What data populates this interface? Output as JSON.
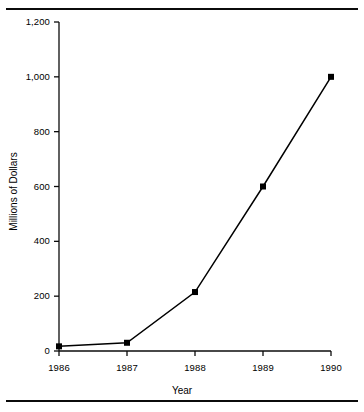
{
  "chart_data": {
    "type": "line",
    "title": "",
    "subtitle": "",
    "xlabel": "Year",
    "ylabel": "Millions of Dollars",
    "categories": [
      "1986",
      "1987",
      "1988",
      "1989",
      "1990"
    ],
    "x": [
      1986,
      1987,
      1988,
      1989,
      1990
    ],
    "values": [
      17,
      30,
      215,
      600,
      1000
    ],
    "series": [
      {
        "name": "Millions of Dollars",
        "values": [
          17,
          30,
          215,
          600,
          1000
        ]
      }
    ],
    "ylim": [
      0,
      1200
    ],
    "yticks": [
      0,
      200,
      400,
      600,
      800,
      1000,
      1200
    ],
    "ytick_labels": [
      "0",
      "200",
      "400",
      "600",
      "800",
      "1,000",
      "1,200"
    ],
    "xtick_labels": [
      "1986",
      "1987",
      "1988",
      "1989",
      "1990"
    ],
    "grid": false,
    "legend": false,
    "legend_position": "none",
    "marker": "square",
    "line_color": "#000000",
    "marker_color": "#000000",
    "background_color": "#ffffff",
    "annotations": []
  },
  "axes": {
    "y": {
      "label": "Millions of Dollars",
      "ticks": [
        {
          "value": 1200,
          "label": "1,200"
        },
        {
          "value": 1000,
          "label": "1,000"
        },
        {
          "value": 800,
          "label": "800"
        },
        {
          "value": 600,
          "label": "600"
        },
        {
          "value": 400,
          "label": "400"
        },
        {
          "value": 200,
          "label": "200"
        },
        {
          "value": 0,
          "label": "0"
        }
      ]
    },
    "x": {
      "label": "Year",
      "ticks": [
        {
          "value": 1986,
          "label": "1986"
        },
        {
          "value": 1987,
          "label": "1987"
        },
        {
          "value": 1988,
          "label": "1988"
        },
        {
          "value": 1989,
          "label": "1989"
        },
        {
          "value": 1990,
          "label": "1990"
        }
      ]
    }
  }
}
